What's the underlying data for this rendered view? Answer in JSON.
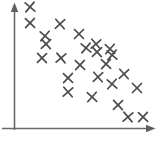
{
  "figure": {
    "width": 166,
    "height": 143,
    "background_color": "#ffffff",
    "title": "",
    "style": "hand-drawn sketch"
  },
  "axes": {
    "origin_x": 14,
    "origin_y": 128,
    "y_axis_top": 4,
    "x_axis_right": 155,
    "color": "#666a6d",
    "arrowheads": true,
    "x_tick_labels": [],
    "y_tick_labels": [],
    "xlabel": "",
    "ylabel": "",
    "grid": false
  },
  "marker": {
    "glyph": "x-cross",
    "color": "#4c4c4e",
    "size": 9,
    "stroke_width": 1.7
  },
  "chart_data": {
    "type": "scatter",
    "title": "",
    "xlabel": "",
    "ylabel": "",
    "grid": false,
    "legend": [],
    "xlim": [
      14,
      155
    ],
    "ylim": [
      4,
      128
    ],
    "axis_direction": "y increases upward",
    "relationship": "negative correlation",
    "n_points": 25,
    "points_pixel": [
      [
        30,
        7
      ],
      [
        30,
        23
      ],
      [
        60,
        24
      ],
      [
        45,
        36
      ],
      [
        79,
        34
      ],
      [
        96,
        44
      ],
      [
        110,
        49
      ],
      [
        42,
        58
      ],
      [
        61,
        58
      ],
      [
        80,
        65
      ],
      [
        97,
        52
      ],
      [
        112,
        55
      ],
      [
        68,
        78
      ],
      [
        98,
        77
      ],
      [
        112,
        84
      ],
      [
        137,
        88
      ],
      [
        68,
        92
      ],
      [
        92,
        97
      ],
      [
        118,
        105
      ],
      [
        128,
        117
      ],
      [
        143,
        117
      ],
      [
        46,
        44
      ],
      [
        86,
        48
      ],
      [
        106,
        64
      ],
      [
        124,
        74
      ]
    ],
    "x": [
      16,
      16,
      46,
      31,
      65,
      82,
      96,
      28,
      47,
      66,
      83,
      98,
      54,
      84,
      98,
      123,
      54,
      78,
      104,
      114,
      129,
      32,
      72,
      92,
      110
    ],
    "y": [
      121,
      105,
      104,
      92,
      94,
      84,
      79,
      70,
      70,
      63,
      76,
      73,
      50,
      51,
      44,
      40,
      36,
      31,
      23,
      11,
      11,
      84,
      80,
      64,
      54
    ]
  }
}
